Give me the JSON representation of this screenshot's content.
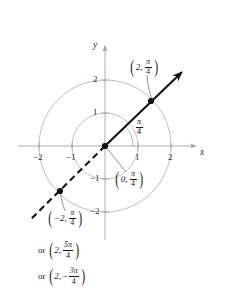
{
  "figure": {
    "type": "polar-point-diagram",
    "width": 226,
    "height": 288,
    "background": "#ffffff"
  },
  "axes": {
    "x_label": "x",
    "y_label": "y",
    "axis_color": "#a0a0a0",
    "tick_color": "#2b2b2b",
    "origin_px": {
      "x": 105,
      "y": 146
    },
    "unit_px": 33,
    "x_ticks": [
      {
        "value": -2,
        "label": "−2"
      },
      {
        "value": -1,
        "label": "−1"
      },
      {
        "value": 1,
        "label": "1"
      },
      {
        "value": 2,
        "label": "2"
      }
    ],
    "y_ticks": [
      {
        "value": 2,
        "label": "2"
      },
      {
        "value": 1,
        "label": "1"
      },
      {
        "value": -1,
        "label": "−1"
      },
      {
        "value": -2,
        "label": "−2"
      }
    ]
  },
  "circles": [
    {
      "radius": 1,
      "color": "#b9b9b9"
    },
    {
      "radius": 2,
      "color": "#b9b9b9"
    }
  ],
  "ray": {
    "angle_label_numerator": "π",
    "angle_label_denominator": "4",
    "angle_degrees": 45,
    "color": "#111111",
    "solid_from_origin_to": {
      "x": 182,
      "y": 72
    },
    "dashed_from_origin_to": {
      "x": 30,
      "y": 220
    },
    "has_arrowhead": true
  },
  "points": [
    {
      "id": "point-upper",
      "px": {
        "x": 151,
        "y": 101
      },
      "r_text": "2",
      "theta_num": "π",
      "theta_den": "4",
      "sign": ""
    },
    {
      "id": "point-lower",
      "px": {
        "x": 60,
        "y": 191
      },
      "r_text": "−2",
      "theta_num": "π",
      "theta_den": "4",
      "sign": ""
    },
    {
      "id": "point-origin",
      "px": {
        "x": 105,
        "y": 146
      },
      "r_text": "0",
      "theta_num": "π",
      "theta_den": "4",
      "sign": ""
    }
  ],
  "labels": {
    "upper_point": {
      "r": "2",
      "comma": ",",
      "num": "π",
      "den": "4"
    },
    "origin_point": {
      "r": "0",
      "comma": ",",
      "num": "π",
      "den": "4"
    },
    "lower_point": {
      "r": "−2",
      "comma": ",",
      "num": "π",
      "den": "4"
    },
    "alt_one": {
      "or": "or",
      "r": "2",
      "comma": ",",
      "num": "5π",
      "den": "4"
    },
    "alt_two": {
      "or": "or",
      "r": "2",
      "comma": ",",
      "sign": "−",
      "num": "3π",
      "den": "4"
    },
    "angle": {
      "num": "π",
      "den": "4"
    }
  },
  "parens": {
    "left": "(",
    "right": ")"
  }
}
